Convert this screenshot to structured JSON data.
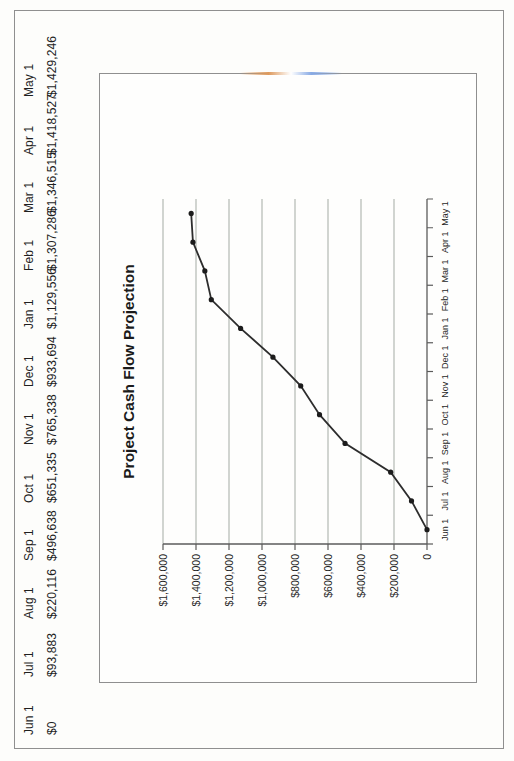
{
  "page": {
    "kind": "scanned printed report, landscape content rotated on portrait scan",
    "border_color": "#8f8f8f",
    "background": "#fdfdfb"
  },
  "table": {
    "months": [
      "Jun 1",
      "Jul 1",
      "Aug 1",
      "Sep 1",
      "Oct 1",
      "Nov 1",
      "Dec 1",
      "Jan 1",
      "Feb 1",
      "Mar 1",
      "Apr 1",
      "May 1"
    ],
    "values": [
      "$0",
      "$93,883",
      "$220,116",
      "$496,638",
      "$651,335",
      "$765,338",
      "$933,694",
      "$1,129,556",
      "$1,307,286",
      "$1,346,515",
      "$1,418,527",
      "$1,429,246"
    ]
  },
  "chart_data": {
    "type": "line",
    "title": "Project Cash Flow Projection",
    "x": [
      "Jun 1",
      "Jul 1",
      "Aug 1",
      "Sep 1",
      "Oct 1",
      "Nov 1",
      "Dec 1",
      "Jan 1",
      "Feb 1",
      "Mar 1",
      "Apr 1",
      "May 1"
    ],
    "values": [
      0,
      93883,
      220116,
      496638,
      651335,
      765338,
      933694,
      1129556,
      1307286,
      1346515,
      1418527,
      1429246
    ],
    "xlabel": "",
    "ylabel": "",
    "ylim": [
      0,
      1600000
    ],
    "ytick_step": 200000,
    "ytick_labels": [
      "0",
      "$200,000",
      "$400,000",
      "$600,000",
      "$800,000",
      "$1,000,000",
      "$1,200,000",
      "$1,400,000",
      "$1,600,000"
    ],
    "grid": true,
    "legend": "none",
    "marker": "filled-dot",
    "colors": {
      "line": "#2d2d2d",
      "marker": "#1c1c1c",
      "grid": "#a4aba4",
      "axis": "#5b5b5b",
      "text": "#1f1f1f"
    }
  }
}
